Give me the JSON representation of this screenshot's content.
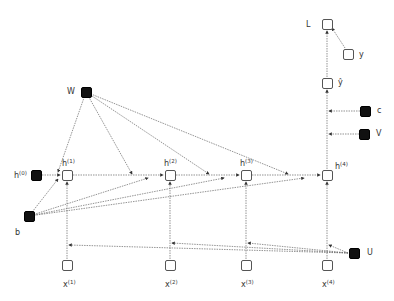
{
  "diagram": {
    "type": "unrolled-rnn-computational-graph",
    "nodes": {
      "L": {
        "label": "L",
        "kind": "loss"
      },
      "y": {
        "label": "y",
        "kind": "target"
      },
      "yhat": {
        "label": "ŷ",
        "kind": "output"
      },
      "c": {
        "label": "c",
        "kind": "parameter"
      },
      "V": {
        "label": "V",
        "kind": "parameter"
      },
      "W": {
        "label": "W",
        "kind": "parameter"
      },
      "b": {
        "label": "b",
        "kind": "parameter"
      },
      "U": {
        "label": "U",
        "kind": "parameter"
      },
      "h0": {
        "base": "h",
        "sup": "(0)",
        "kind": "parameter"
      },
      "h1": {
        "base": "h",
        "sup": "(1)",
        "kind": "hidden"
      },
      "h2": {
        "base": "h",
        "sup": "(2)",
        "kind": "hidden"
      },
      "h3": {
        "base": "h",
        "sup": "(3)",
        "kind": "hidden"
      },
      "h4": {
        "base": "h",
        "sup": "(4)",
        "kind": "hidden"
      },
      "x1": {
        "base": "x",
        "sup": "(1)",
        "kind": "input"
      },
      "x2": {
        "base": "x",
        "sup": "(2)",
        "kind": "input"
      },
      "x3": {
        "base": "x",
        "sup": "(3)",
        "kind": "input"
      },
      "x4": {
        "base": "x",
        "sup": "(4)",
        "kind": "input"
      }
    },
    "colors": {
      "parameter_fill": "#111111",
      "open_border": "#555555",
      "edge": "#555555"
    }
  }
}
